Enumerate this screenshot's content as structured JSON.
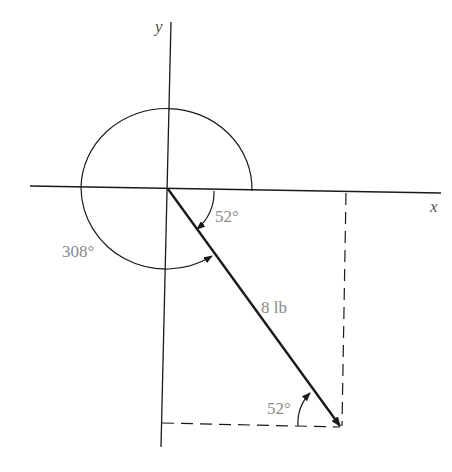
{
  "diagram": {
    "type": "vector-angle-diagram",
    "axes": {
      "x_label": "x",
      "y_label": "y"
    },
    "vector": {
      "magnitude_label": "8 lb"
    },
    "angles": {
      "reference_angle_label": "52°",
      "direction_angle_label": "308°",
      "triangle_angle_label": "52°"
    },
    "colors": {
      "line": "#1a1a1a",
      "label": "#8a8a8a",
      "axis_label": "#555555",
      "background": "#ffffff"
    }
  }
}
